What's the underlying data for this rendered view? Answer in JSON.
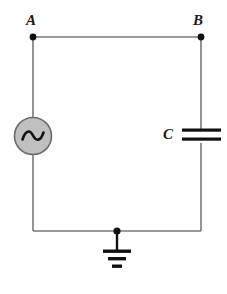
{
  "diagram": {
    "type": "circuit-schematic",
    "background_color": "#ffffff",
    "wire_color": "#7a7a7a",
    "node_color": "#111111",
    "component_fill": "#c0c0c0",
    "component_stroke": "#6b6b6b",
    "plate_color": "#111111",
    "ground_color": "#111111",
    "labels": {
      "node_a": "A",
      "node_b": "B",
      "capacitor": "C"
    },
    "nodes": [
      {
        "name": "A",
        "x": 33,
        "y": 37,
        "label": "A"
      },
      {
        "name": "B",
        "x": 201,
        "y": 37,
        "label": "B"
      },
      {
        "name": "ground-tap",
        "x": 117,
        "y": 231,
        "label": ""
      }
    ],
    "components": [
      {
        "name": "ac-source",
        "kind": "ac-voltage-source",
        "symbol": "sine-in-circle",
        "cx": 33,
        "cy": 136,
        "radius": 19
      },
      {
        "name": "capacitor",
        "kind": "capacitor",
        "symbol": "parallel-plates",
        "label": "C",
        "cx": 201,
        "cy": 136,
        "plate_width": 39,
        "plate_thickness": 3,
        "plate_gap": 5
      },
      {
        "name": "ground",
        "kind": "earth-ground",
        "symbol": "three-bar-ground",
        "x": 117,
        "y_top": 231,
        "bar_widths": [
          28,
          18,
          10
        ]
      }
    ],
    "wires": [
      {
        "name": "top-wire",
        "x1": 33,
        "y1": 37,
        "x2": 201,
        "y2": 37
      },
      {
        "name": "left-wire-upper",
        "x1": 33,
        "y1": 37,
        "x2": 33,
        "y2": 117
      },
      {
        "name": "left-wire-lower",
        "x1": 33,
        "y1": 155,
        "x2": 33,
        "y2": 231
      },
      {
        "name": "right-wire-upper",
        "x1": 201,
        "y1": 37,
        "x2": 201,
        "y2": 129
      },
      {
        "name": "right-wire-lower",
        "x1": 201,
        "y1": 143,
        "x2": 201,
        "y2": 231
      },
      {
        "name": "bottom-wire",
        "x1": 33,
        "y1": 231,
        "x2": 201,
        "y2": 231
      }
    ]
  }
}
